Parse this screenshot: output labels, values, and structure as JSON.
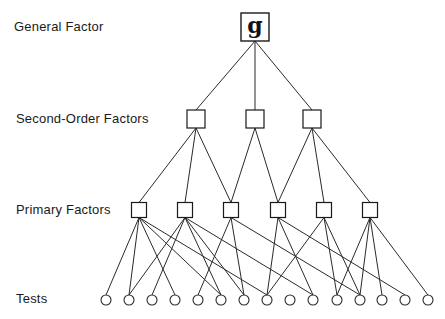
{
  "levels": {
    "general": {
      "label": "General Factor"
    },
    "second_order": {
      "label": "Second-Order Factors"
    },
    "primary": {
      "label": "Primary Factors"
    },
    "tests": {
      "label": "Tests"
    }
  },
  "general_factor": {
    "symbol": "g",
    "x": 255,
    "y": 27,
    "size": 28
  },
  "second_order_factors": [
    {
      "id": "S1",
      "x": 196,
      "y": 119
    },
    {
      "id": "S2",
      "x": 255,
      "y": 119
    },
    {
      "id": "S3",
      "x": 312,
      "y": 119
    }
  ],
  "primary_factors": [
    {
      "id": "P1",
      "x": 139,
      "y": 210
    },
    {
      "id": "P2",
      "x": 185,
      "y": 210
    },
    {
      "id": "P3",
      "x": 231,
      "y": 210
    },
    {
      "id": "P4",
      "x": 278,
      "y": 210
    },
    {
      "id": "P5",
      "x": 324,
      "y": 210
    },
    {
      "id": "P6",
      "x": 370,
      "y": 210
    }
  ],
  "tests": [
    {
      "id": "T1",
      "x": 106
    },
    {
      "id": "T2",
      "x": 129
    },
    {
      "id": "T3",
      "x": 152
    },
    {
      "id": "T4",
      "x": 175
    },
    {
      "id": "T5",
      "x": 198
    },
    {
      "id": "T6",
      "x": 221
    },
    {
      "id": "T7",
      "x": 244
    },
    {
      "id": "T8",
      "x": 267
    },
    {
      "id": "T9",
      "x": 290
    },
    {
      "id": "T10",
      "x": 313
    },
    {
      "id": "T11",
      "x": 337
    },
    {
      "id": "T12",
      "x": 360
    },
    {
      "id": "T13",
      "x": 382
    },
    {
      "id": "T14",
      "x": 405
    },
    {
      "id": "T15",
      "x": 428
    }
  ],
  "tests_y": 300,
  "edges": {
    "g_to_second": [
      "S1",
      "S2",
      "S3"
    ],
    "second_to_primary": [
      [
        "S1",
        "P1"
      ],
      [
        "S1",
        "P2"
      ],
      [
        "S1",
        "P3"
      ],
      [
        "S2",
        "P3"
      ],
      [
        "S2",
        "P4"
      ],
      [
        "S3",
        "P4"
      ],
      [
        "S3",
        "P5"
      ],
      [
        "S3",
        "P6"
      ]
    ],
    "primary_to_tests": [
      [
        "P1",
        "T1"
      ],
      [
        "P1",
        "T2"
      ],
      [
        "P1",
        "T4"
      ],
      [
        "P1",
        "T6"
      ],
      [
        "P1",
        "T8"
      ],
      [
        "P2",
        "T2"
      ],
      [
        "P2",
        "T3"
      ],
      [
        "P2",
        "T6"
      ],
      [
        "P2",
        "T7"
      ],
      [
        "P2",
        "T10"
      ],
      [
        "P3",
        "T5"
      ],
      [
        "P3",
        "T7"
      ],
      [
        "P3",
        "T12"
      ],
      [
        "P4",
        "T8"
      ],
      [
        "P4",
        "T10"
      ],
      [
        "P4",
        "T14"
      ],
      [
        "P5",
        "T8"
      ],
      [
        "P5",
        "T11"
      ],
      [
        "P5",
        "T12"
      ],
      [
        "P6",
        "T11"
      ],
      [
        "P6",
        "T12"
      ],
      [
        "P6",
        "T13"
      ],
      [
        "P6",
        "T15"
      ]
    ]
  }
}
